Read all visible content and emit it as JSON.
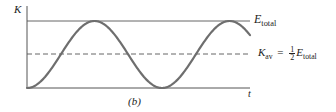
{
  "figure": {
    "panel_label": "(b)",
    "y_axis_label": "K",
    "x_axis_label": "t",
    "etotal_label": {
      "symbol": "E",
      "subscript": "total"
    },
    "kav_label": {
      "symbol": "K",
      "subscript": "av",
      "equals": "=",
      "frac_num": "1",
      "frac_den": "2",
      "rhs_symbol": "E",
      "rhs_subscript": "total"
    },
    "colors": {
      "curve": "#6e6e6e",
      "axes": "#555555",
      "lines": "#555555",
      "text": "#222222"
    }
  },
  "chart_data": {
    "type": "line",
    "title": "",
    "xlabel": "t",
    "ylabel": "K",
    "series": [
      {
        "name": "K(t)",
        "formula": "K = E_total * sin^2(omega t)",
        "x_periods": [
          0,
          0.5,
          1.0,
          1.5,
          1.65
        ],
        "y_fraction_of_Etotal": [
          0,
          1,
          0,
          1,
          0.8
        ]
      }
    ],
    "reference_lines": [
      {
        "name": "E_total",
        "y_fraction": 1.0,
        "style": "solid"
      },
      {
        "name": "K_av = 1/2 E_total",
        "y_fraction": 0.5,
        "style": "dashed"
      }
    ],
    "ylim": [
      0,
      1.0
    ],
    "grid": false,
    "ticks": "none"
  }
}
